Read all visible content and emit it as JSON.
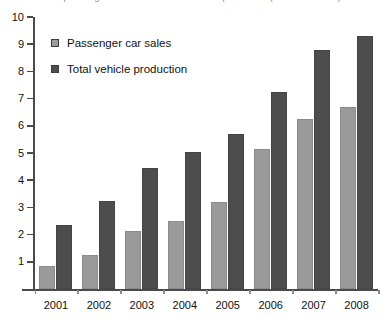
{
  "title_cropped": "Chinese passenger car sales and total vehicle production (millions of units)",
  "chart_data": {
    "type": "bar",
    "title": "",
    "xlabel": "",
    "ylabel": "",
    "ylim": [
      0,
      10
    ],
    "yticks": [
      0,
      1,
      2,
      3,
      4,
      5,
      6,
      7,
      8,
      9,
      10
    ],
    "ytick_labels": [
      "",
      "1",
      "2",
      "3",
      "4",
      "5",
      "6",
      "7",
      "8",
      "9",
      "10"
    ],
    "grid": false,
    "legend_position": "upper-left-inside",
    "categories": [
      "2001",
      "2002",
      "2003",
      "2004",
      "2005",
      "2006",
      "2007",
      "2008"
    ],
    "series": [
      {
        "name": "Passenger car sales",
        "color": "#9a9a9a",
        "values": [
          0.85,
          1.25,
          2.15,
          2.5,
          3.2,
          5.15,
          6.25,
          6.7
        ]
      },
      {
        "name": "Total vehicle production",
        "color": "#4d4d4d",
        "values": [
          2.35,
          3.25,
          4.45,
          5.05,
          5.7,
          7.25,
          8.8,
          9.3
        ]
      }
    ]
  },
  "axis": {
    "line_color": "#4a4a4a",
    "tick_color": "#8a8a8a"
  }
}
